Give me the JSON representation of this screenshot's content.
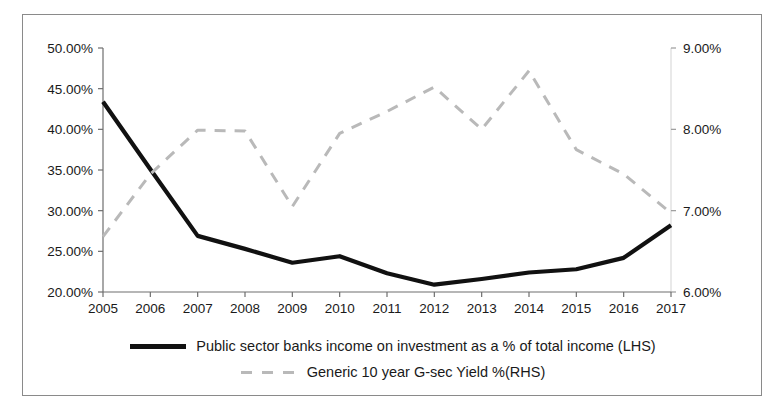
{
  "chart_data": {
    "type": "line",
    "title": "",
    "xlabel": "",
    "grid": false,
    "legend_position": "bottom",
    "categories": [
      2005,
      2006,
      2007,
      2008,
      2009,
      2010,
      2011,
      2012,
      2013,
      2014,
      2015,
      2016,
      2017
    ],
    "x_tick_labels": [
      "2005",
      "2006",
      "2007",
      "2008",
      "2009",
      "2010",
      "2011",
      "2012",
      "2013",
      "2014",
      "2015",
      "2016",
      "2017"
    ],
    "axes": {
      "left": {
        "label": "",
        "ylim": [
          20,
          50
        ],
        "tick_values": [
          20,
          25,
          30,
          35,
          40,
          45,
          50
        ],
        "tick_labels": [
          "20.00%",
          "25.00%",
          "30.00%",
          "35.00%",
          "40.00%",
          "45.00%",
          "50.00%"
        ]
      },
      "right": {
        "label": "",
        "ylim": [
          6,
          9
        ],
        "tick_values": [
          6,
          7,
          8,
          9
        ],
        "tick_labels": [
          "6.00%",
          "7.00%",
          "8.00%",
          "9.00%"
        ]
      }
    },
    "series": [
      {
        "name": "Public sector banks income on investment as a % of total income (LHS)",
        "axis": "left",
        "color": "#111111",
        "style": "solid",
        "values": [
          43.4,
          35.1,
          26.9,
          25.3,
          23.6,
          24.4,
          22.3,
          20.9,
          21.6,
          22.4,
          22.8,
          24.2,
          28.2
        ]
      },
      {
        "name": "Generic 10 year G-sec Yield %(RHS)",
        "axis": "right",
        "color": "#b9b9b9",
        "style": "dashed",
        "values": [
          6.68,
          7.45,
          7.99,
          7.98,
          7.05,
          7.95,
          8.22,
          8.52,
          8.0,
          8.72,
          7.75,
          7.45,
          6.97
        ]
      }
    ]
  },
  "legend": {
    "entries": [
      {
        "label": "Public sector banks income on investment as a % of total income (LHS)",
        "style": "solid",
        "swatch_name": "legend-swatch-solid"
      },
      {
        "label": "Generic 10 year G-sec Yield %(RHS)",
        "style": "dashed",
        "swatch_name": "legend-swatch-dashed"
      }
    ]
  }
}
